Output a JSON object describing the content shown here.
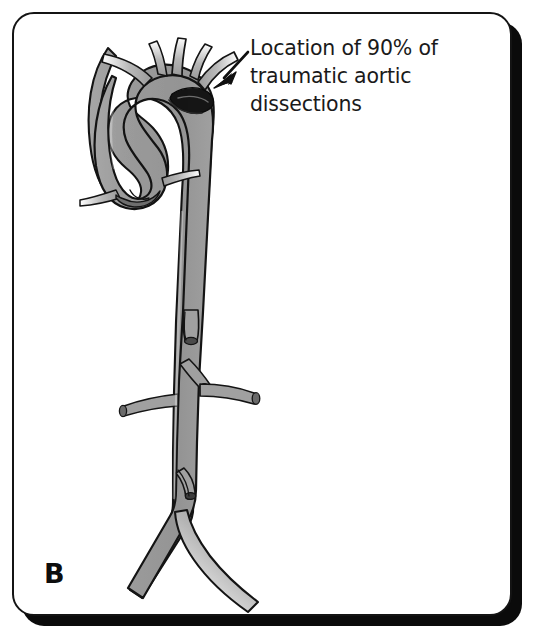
{
  "figure": {
    "panel_letter": "B",
    "medium": "halftone-grayscale-line-art"
  },
  "annotation": {
    "line1": "Location of 90% of",
    "line2": "traumatic aortic",
    "line3": "dissections",
    "full_text": "Location of 90% of traumatic aortic dissections",
    "percentage": "90%",
    "pointer": "arrow-pointing-down-left"
  },
  "anatomy": {
    "vessel_label": "aorta",
    "arch_branches": [
      "brachiocephalic-trunk",
      "left-common-carotid-artery",
      "left-subclavian-artery"
    ],
    "root_branches": [
      "right-coronary-artery",
      "left-coronary-artery"
    ],
    "abdominal_branches": [
      "celiac-trunk-stump",
      "superior-mesenteric-artery-stump",
      "right-renal-artery",
      "left-renal-artery",
      "inferior-mesenteric-artery-stump"
    ],
    "terminal_branches": [
      "right-common-iliac-artery",
      "left-common-iliac-artery"
    ],
    "marked_site": "aortic-isthmus-dissection-zone"
  },
  "colors": {
    "vessel_fill": "#9a9a9a",
    "vessel_fill_light": "#b9b9b9",
    "vessel_outline": "#141414",
    "dissection_marker": "#111111",
    "frame_border": "#141414",
    "frame_shadow": "#0b0b0b",
    "background": "#ffffff",
    "text": "#1a1a1a"
  },
  "canvas": {
    "width": "535",
    "height": "644"
  }
}
